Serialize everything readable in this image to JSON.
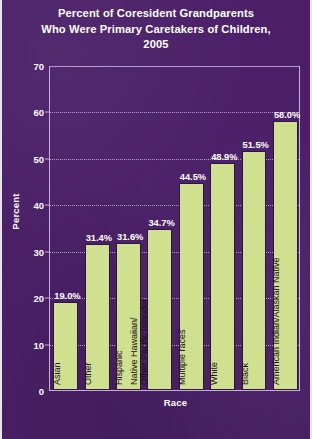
{
  "chart_data": {
    "type": "bar",
    "title": "Percent of Coresident Grandparents Who Were Primary Caretakers of Children, 2005",
    "title_lines": [
      "Percent of Coresident Grandparents",
      "Who Were Primary Caretakers of Children,",
      "2005"
    ],
    "xlabel": "Race",
    "ylabel": "Percent",
    "ylim": [
      0,
      70
    ],
    "yticks": [
      0,
      10,
      20,
      30,
      40,
      50,
      60,
      70
    ],
    "grid": "horizontal-dotted",
    "legend": "none",
    "categories": [
      "Asian",
      "Other",
      "Hispanic",
      "Native Hawaiian/ Other Pacific Islander",
      "Multiple races",
      "White",
      "Black",
      "American Indian/Alaskan Native"
    ],
    "category_lines": [
      [
        "Asian"
      ],
      [
        "Other"
      ],
      [
        "Hispanic"
      ],
      [
        "Native Hawaiian/",
        "Other Pacific Islander"
      ],
      [
        "Multiple races"
      ],
      [
        "White"
      ],
      [
        "Black"
      ],
      [
        "American Indian/Alaskan Native"
      ]
    ],
    "values": [
      19.0,
      31.4,
      31.6,
      34.7,
      44.5,
      48.9,
      51.5,
      58.0
    ],
    "value_labels": [
      "19.0%",
      "31.4%",
      "31.6%",
      "34.7%",
      "44.5%",
      "48.9%",
      "51.5%",
      "58.0%"
    ]
  },
  "colors": {
    "background": "#4b2068",
    "bar_fill": "#cfe08f",
    "bar_outline": "#2e1440",
    "text": "#ffffff",
    "category_text": "#1d1022",
    "grid": "#c9b2de",
    "frame": "#c7aee0"
  }
}
